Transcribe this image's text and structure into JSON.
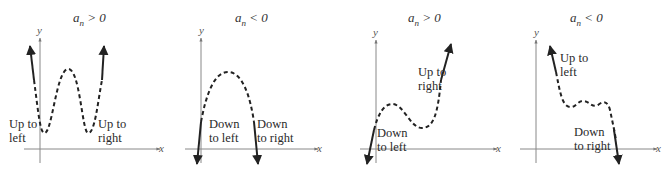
{
  "panels": [
    {
      "title_coef": "a",
      "title_sub": "n",
      "title_rel": "> 0",
      "x_axis_label": "x",
      "y_axis_label": "y",
      "labels": [
        {
          "line1": "Up to",
          "line2": "left"
        },
        {
          "line1": "Up to",
          "line2": "right"
        }
      ]
    },
    {
      "title_coef": "a",
      "title_sub": "n",
      "title_rel": "< 0",
      "x_axis_label": "x",
      "y_axis_label": "y",
      "labels": [
        {
          "line1": "Down",
          "line2": "to left"
        },
        {
          "line1": "Down",
          "line2": "to right"
        }
      ]
    },
    {
      "title_coef": "a",
      "title_sub": "n",
      "title_rel": "> 0",
      "x_axis_label": "x",
      "y_axis_label": "y",
      "labels": [
        {
          "line1": "Down",
          "line2": "to left"
        },
        {
          "line1": "Up to",
          "line2": "right"
        }
      ]
    },
    {
      "title_coef": "a",
      "title_sub": "n",
      "title_rel": "< 0",
      "x_axis_label": "x",
      "y_axis_label": "y",
      "labels": [
        {
          "line1": "Up to",
          "line2": "left"
        },
        {
          "line1": "Down",
          "line2": "to right"
        }
      ]
    }
  ]
}
